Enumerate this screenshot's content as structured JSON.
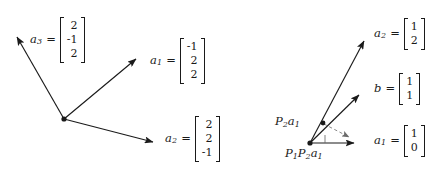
{
  "figure": {
    "background_color": "#ffffff",
    "stroke_color": "#1a1a1a",
    "width": 447,
    "height": 183
  },
  "left_diagram": {
    "name": "three-dimensional-vector-triple",
    "origin_label": "",
    "vectors": [
      {
        "id": "a3",
        "label": "a",
        "subscript": "3",
        "equals": "=",
        "components": [
          "2",
          "-1",
          "2"
        ],
        "tip": {
          "x": 15,
          "y": 35
        }
      },
      {
        "id": "a1",
        "label": "a",
        "subscript": "1",
        "equals": "=",
        "components": [
          "-1",
          "2",
          "2"
        ],
        "tip": {
          "x": 138,
          "y": 57
        }
      },
      {
        "id": "a2",
        "label": "a",
        "subscript": "2",
        "equals": "=",
        "components": [
          "2",
          "2",
          "-1"
        ],
        "tip": {
          "x": 155,
          "y": 143
        }
      }
    ],
    "origin": {
      "x": 64,
      "y": 119
    }
  },
  "right_diagram": {
    "name": "alternating-projection-diagram",
    "origin": {
      "x": 310,
      "y": 143
    },
    "vectors": [
      {
        "id": "a2",
        "label": "a",
        "subscript": "2",
        "equals": "=",
        "components": [
          "1",
          "2"
        ],
        "tip": {
          "x": 366,
          "y": 38
        }
      },
      {
        "id": "b",
        "label": "b",
        "subscript": "",
        "equals": "=",
        "components": [
          "1",
          "1"
        ],
        "tip": {
          "x": 362,
          "y": 93
        }
      },
      {
        "id": "a1",
        "label": "a",
        "subscript": "1",
        "equals": "=",
        "components": [
          "1",
          "0"
        ],
        "tip": {
          "x": 362,
          "y": 143
        }
      }
    ],
    "points": [
      {
        "id": "P2a1",
        "label_parts": [
          {
            "text": "P",
            "sub": "2"
          },
          {
            "text": "a",
            "sub": "1"
          }
        ],
        "label_text": "P2a1",
        "x": 323,
        "y": 123
      },
      {
        "id": "P1P2a1",
        "label_parts": [
          {
            "text": "P",
            "sub": "1"
          },
          {
            "text": "P",
            "sub": "2"
          },
          {
            "text": "a",
            "sub": "1"
          }
        ],
        "label_text": "P1P2a1",
        "x": 310,
        "y": 143
      }
    ],
    "dashed_projection": {
      "from": {
        "x": 323,
        "y": 123
      },
      "to": {
        "x": 352,
        "y": 138
      },
      "style": "dashed"
    },
    "right_angle_tick": {
      "x": 325,
      "y": 143,
      "height": 8
    }
  }
}
